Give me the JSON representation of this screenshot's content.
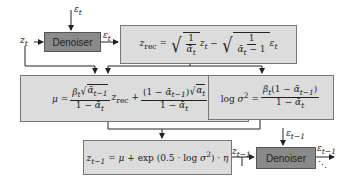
{
  "diagram": {
    "denoiser_1": {
      "label": "Denoiser"
    },
    "denoiser_2": {
      "label": "Denoiser"
    },
    "labels": {
      "eps_t_in": "ε_t",
      "z_t_in": "z_t",
      "eps_t_out": "ε_t",
      "eps_t1_in": "ε_{t−1}",
      "z_t1_in": "z_{t−1}",
      "eps_t1_out": "ε_{t−1}",
      "continuation": "⋱"
    },
    "equations": {
      "z_rec": "z_rec = sqrt(1/ᾱ_t) z_t − sqrt(1/(ᾱ_t − 1)) ε_t",
      "mu": "μ = (β_t sqrt(ᾱ_{t−1}) / (1 − ᾱ_t)) z_rec + ((1 − ᾱ_{t−1}) sqrt(α_t) / (1 − ᾱ_t)) z_t",
      "log_sigma": "log σ² = β_t (1 − ᾱ_{t−1}) / (1 − ᾱ_t)",
      "z_next": "z_{t−1} = μ + exp(0.5 · log σ²) · η"
    },
    "colors": {
      "denoiser_fill": "#8a8a8a",
      "equation_fill": "#dcdcdc",
      "line": "#222222"
    }
  }
}
